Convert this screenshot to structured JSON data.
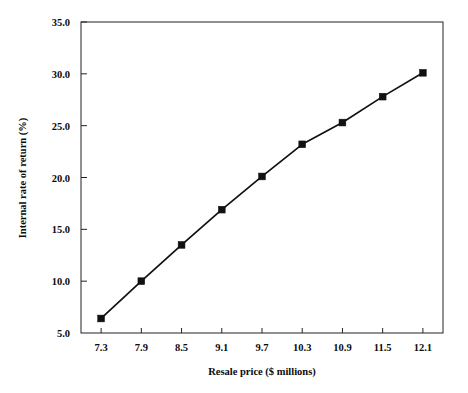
{
  "chart_data": {
    "type": "line",
    "title": "",
    "xlabel": "Resale price ($ millions)",
    "ylabel": "Internal rate of return (%)",
    "x": [
      7.3,
      7.9,
      8.5,
      9.1,
      9.7,
      10.3,
      10.9,
      11.5,
      12.1
    ],
    "values": [
      6.4,
      10.0,
      13.5,
      16.9,
      20.1,
      23.2,
      25.3,
      27.8,
      30.1
    ],
    "categories": [
      "7.3",
      "7.9",
      "8.5",
      "9.1",
      "9.7",
      "10.3",
      "10.9",
      "11.5",
      "12.1"
    ],
    "xticklabels": [
      "7.3",
      "7.9",
      "8.5",
      "9.1",
      "9.7",
      "10.3",
      "10.9",
      "11.5",
      "12.1"
    ],
    "yticklabels": [
      "5.0",
      "10.0",
      "15.0",
      "20.0",
      "25.0",
      "30.0",
      "35.0"
    ],
    "yticks": [
      5.0,
      10.0,
      15.0,
      20.0,
      25.0,
      30.0,
      35.0
    ],
    "xlim": [
      7.0,
      12.4
    ],
    "ylim": [
      5.0,
      35.0
    ],
    "grid": false,
    "legend": null,
    "legend_position": "none",
    "marker": "square",
    "series_color": "#111111",
    "background_color": "#ffffff"
  }
}
